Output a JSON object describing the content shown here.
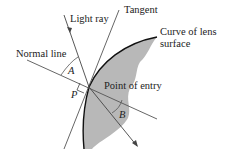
{
  "diagram": {
    "type": "refraction-at-lens-surface",
    "labels": {
      "light_ray": "Light ray",
      "tangent": "Tangent",
      "normal_line": "Normal line",
      "curve": "Curve of lens",
      "curve_line2": "surface",
      "point_of_entry": "Point of entry",
      "angle_a": "A",
      "angle_b": "B",
      "point_p": "P"
    },
    "colors": {
      "lens_fill": "#b8b8b8",
      "line": "#444444",
      "curve": "#111111"
    }
  }
}
